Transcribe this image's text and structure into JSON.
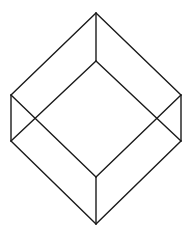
{
  "diagram": {
    "type": "wireframe-cube",
    "stroke_color": "#1a1a1a",
    "background": "#ffffff",
    "vertices": {
      "top": [
        96,
        13
      ],
      "left_top": [
        11,
        95
      ],
      "right_top": [
        181,
        95
      ],
      "inner_top": [
        96,
        61
      ],
      "left_bottom": [
        11,
        141
      ],
      "right_bottom": [
        181,
        141
      ],
      "inner_bottom": [
        96,
        177
      ],
      "bottom": [
        96,
        224
      ]
    },
    "edges": [
      [
        "top",
        "left_top"
      ],
      [
        "top",
        "right_top"
      ],
      [
        "top",
        "inner_top"
      ],
      [
        "inner_top",
        "left_bottom"
      ],
      [
        "inner_top",
        "right_bottom"
      ],
      [
        "left_top",
        "left_bottom"
      ],
      [
        "right_top",
        "right_bottom"
      ],
      [
        "left_top",
        "inner_bottom"
      ],
      [
        "right_top",
        "inner_bottom"
      ],
      [
        "left_bottom",
        "bottom"
      ],
      [
        "right_bottom",
        "bottom"
      ],
      [
        "inner_bottom",
        "bottom"
      ]
    ]
  }
}
